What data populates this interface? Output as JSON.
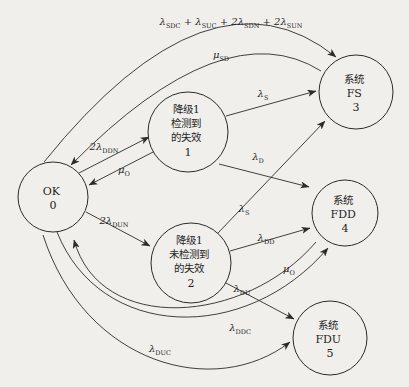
{
  "figure": {
    "type": "markov-state-transition-diagram",
    "background": "#f0efec",
    "ink": "#2b2b2b"
  },
  "nodes": {
    "ok": {
      "lines": [
        "OK",
        "0"
      ]
    },
    "s1": {
      "lines": [
        "降级1",
        "检测到",
        "的失效",
        "1"
      ]
    },
    "s2": {
      "lines": [
        "降级1",
        "未检测到",
        "的失效",
        "2"
      ]
    },
    "fs": {
      "lines": [
        "系统",
        "FS",
        "3"
      ]
    },
    "fdd": {
      "lines": [
        "系统",
        "FDD",
        "4"
      ]
    },
    "fdu": {
      "lines": [
        "系统",
        "FDU",
        "5"
      ]
    }
  },
  "edge_labels": {
    "e03": {
      "parts": [
        {
          "t": "λ",
          "s": "SDC"
        },
        {
          "t": " + λ",
          "s": "SUC"
        },
        {
          "t": " + 2λ",
          "s": "SDN"
        },
        {
          "t": " + 2λ",
          "s": "SUN"
        }
      ]
    },
    "e30": {
      "parts": [
        {
          "t": "μ",
          "s": "SD"
        }
      ]
    },
    "e01": {
      "parts": [
        {
          "t": "2λ",
          "s": "DDN"
        }
      ]
    },
    "e10": {
      "parts": [
        {
          "t": "μ",
          "s": "O"
        }
      ]
    },
    "e02": {
      "parts": [
        {
          "t": "2λ",
          "s": "DUN"
        }
      ]
    },
    "e13": {
      "parts": [
        {
          "t": "λ",
          "s": "S"
        }
      ]
    },
    "e14": {
      "parts": [
        {
          "t": "λ",
          "s": "D"
        }
      ]
    },
    "e23": {
      "parts": [
        {
          "t": "λ",
          "s": "S"
        }
      ]
    },
    "e24": {
      "parts": [
        {
          "t": "λ",
          "s": "DD"
        }
      ]
    },
    "e25": {
      "parts": [
        {
          "t": "λ",
          "s": "DU"
        }
      ]
    },
    "e04": {
      "parts": [
        {
          "t": "λ",
          "s": "DDC"
        }
      ]
    },
    "e40": {
      "parts": [
        {
          "t": "μ",
          "s": "O"
        }
      ]
    },
    "e05": {
      "parts": [
        {
          "t": "λ",
          "s": "DUC"
        }
      ]
    }
  }
}
